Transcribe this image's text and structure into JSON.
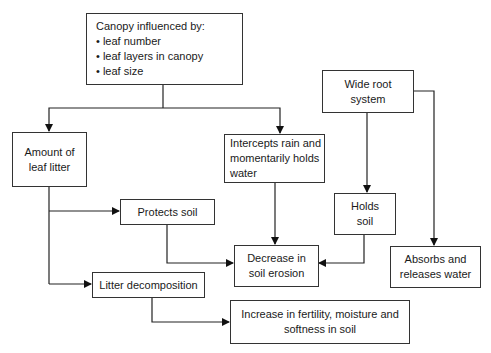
{
  "diagram": {
    "nodes": {
      "canopy": {
        "title": "Canopy influenced by:",
        "bullets": [
          "• leaf number",
          "• leaf layers in canopy",
          "• leaf size"
        ]
      },
      "leaf_litter": {
        "lines": [
          "Amount of",
          "leaf litter"
        ]
      },
      "intercepts": {
        "lines": [
          "Intercepts rain and",
          "momentarily holds",
          "water"
        ]
      },
      "root": {
        "lines": [
          "Wide root",
          "system"
        ]
      },
      "holds_soil": {
        "lines": [
          "Holds",
          "soil"
        ]
      },
      "absorbs": {
        "lines": [
          "Absorbs and",
          "releases water"
        ]
      },
      "protects": {
        "lines": [
          "Protects soil"
        ]
      },
      "decrease": {
        "lines": [
          "Decrease in",
          "soil erosion"
        ]
      },
      "decomposition": {
        "lines": [
          "Litter decomposition"
        ]
      },
      "increase": {
        "lines": [
          "Increase in fertility, moisture and",
          "softness in soil"
        ]
      }
    },
    "edges": [
      [
        "canopy",
        "leaf_litter"
      ],
      [
        "canopy",
        "intercepts"
      ],
      [
        "leaf_litter",
        "protects"
      ],
      [
        "leaf_litter",
        "decomposition"
      ],
      [
        "protects",
        "decrease"
      ],
      [
        "intercepts",
        "decrease"
      ],
      [
        "root",
        "holds_soil"
      ],
      [
        "root",
        "absorbs"
      ],
      [
        "holds_soil",
        "decrease"
      ],
      [
        "decomposition",
        "increase"
      ]
    ]
  }
}
